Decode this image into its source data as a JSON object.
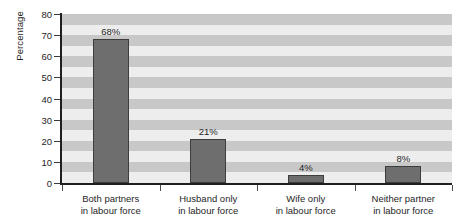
{
  "chart_data": {
    "type": "bar",
    "title": "",
    "xlabel": "",
    "ylabel": "Percentage",
    "ylim": [
      0,
      80
    ],
    "ytick_step": 10,
    "yticks": [
      80,
      70,
      60,
      50,
      40,
      30,
      20,
      10,
      0
    ],
    "grid": false,
    "banded_background": true,
    "band_step": 5,
    "legend": null,
    "categories": [
      "Both partners\nin labour force",
      "Husband only\nin labour force",
      "Wife only\nin labour force",
      "Neither partner\nin labour force"
    ],
    "category_lines": [
      [
        "Both partners",
        "in labour force"
      ],
      [
        "Husband only",
        "in labour force"
      ],
      [
        "Wife only",
        "in labour force"
      ],
      [
        "Neither partner",
        "in labour force"
      ]
    ],
    "values": [
      68,
      21,
      4,
      8
    ],
    "data_labels": [
      "68%",
      "21%",
      "4%",
      "8%"
    ]
  },
  "colors": {
    "bar_fill": "#6e6e6e",
    "bar_stroke": "#3d3d3d",
    "band_dark": "#c8c8c8",
    "band_light": "#ededed",
    "axis": "#1f1f1f",
    "text": "#1f1f1f",
    "page_background": "#ffffff"
  }
}
